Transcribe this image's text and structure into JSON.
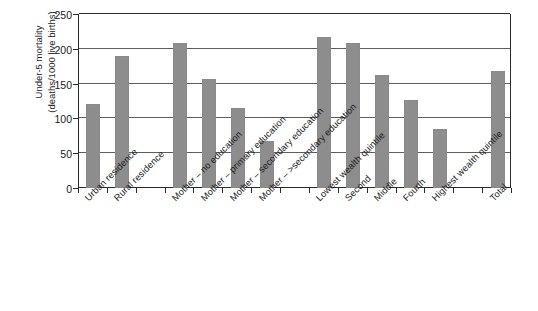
{
  "chart_data": {
    "type": "bar",
    "title": "",
    "subtitle": "",
    "xlabel": "",
    "ylabel": "Under-5 mortality (deaths/1000 live births)",
    "ylabel_line1": "Under-5 mortality",
    "ylabel_line2": "(deaths/1000 live births)",
    "ylim": [
      0,
      250
    ],
    "yticks": [
      0,
      50,
      100,
      150,
      200,
      250
    ],
    "ytick_labels": [
      "0",
      "50",
      "100",
      "150",
      "200",
      "250"
    ],
    "grid": true,
    "grid_axis": "y",
    "legend": false,
    "legend_position": "none",
    "bar_color": "#8d8d8d",
    "axis_color": "#2b2b2b",
    "gridline_color": "#5d5d5d",
    "background": "#ffffff",
    "categories": [
      "Urban residence",
      "Rural residence",
      "Mother – no education",
      "Mother – primary education",
      "Mother – secondary education",
      "Mother – >secondary education",
      "Lowest wealth quintile",
      "Second",
      "Middle",
      "Fourth",
      "Highest wealth quintile",
      "Total"
    ],
    "values": [
      121,
      190,
      208,
      157,
      115,
      67,
      217,
      209,
      163,
      126,
      85,
      168
    ],
    "group_gaps_after": [
      1,
      5,
      10
    ],
    "bars": [
      {
        "label": "Urban residence",
        "value": 121,
        "slot": 0
      },
      {
        "label": "Rural residence",
        "value": 190,
        "slot": 1
      },
      {
        "label": "Mother – no education",
        "value": 208,
        "slot": 3
      },
      {
        "label": "Mother – primary education",
        "value": 157,
        "slot": 4
      },
      {
        "label": "Mother – secondary education",
        "value": 115,
        "slot": 5
      },
      {
        "label": "Mother – >secondary education",
        "value": 67,
        "slot": 6
      },
      {
        "label": "Lowest wealth quintile",
        "value": 217,
        "slot": 8
      },
      {
        "label": "Second",
        "value": 209,
        "slot": 9
      },
      {
        "label": "Middle",
        "value": 163,
        "slot": 10
      },
      {
        "label": "Fourth",
        "value": 126,
        "slot": 11
      },
      {
        "label": "Highest wealth quintile",
        "value": 85,
        "slot": 12
      },
      {
        "label": "Total",
        "value": 168,
        "slot": 14
      }
    ],
    "total_slots": 15
  }
}
